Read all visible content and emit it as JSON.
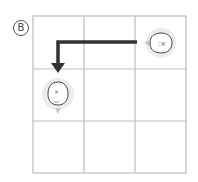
{
  "panel": {
    "label": "B",
    "grid": {
      "rows": 3,
      "cols": 3
    },
    "colors": {
      "grid_line": "#bdbdbd",
      "arrow": "#333333",
      "hint_arrow": "#c8c8c8",
      "token_glow": "#e6e6e6"
    },
    "tokens": [
      {
        "name": "face-token-start",
        "row": 0,
        "col": 2,
        "facing": "left"
      },
      {
        "name": "face-token-end",
        "row": 1,
        "col": 0,
        "facing": "down"
      }
    ],
    "path_arrow": {
      "from": "row0-col2",
      "to": "row1-col0",
      "shape": "left-then-down"
    }
  }
}
